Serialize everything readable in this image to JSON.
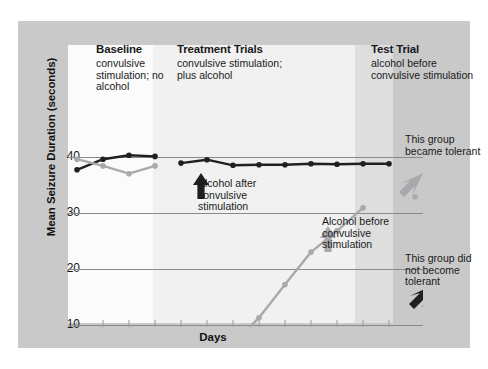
{
  "figure": {
    "y_axis_title": "Mean Seizure Duration (seconds)",
    "x_axis_title": "Days",
    "y_ticks": [
      "40",
      "30",
      "20",
      "10"
    ]
  },
  "sections": [
    {
      "id": "baseline",
      "title": "Baseline",
      "subtitle": "convulsive stimulation; no alcohol"
    },
    {
      "id": "treatment",
      "title": "Treatment Trials",
      "subtitle": "convulsive stimulation; plus alcohol"
    },
    {
      "id": "test",
      "title": "Test Trial",
      "subtitle": "alcohol before convulsive stimulation"
    }
  ],
  "callouts": [
    {
      "id": "alcohol-after",
      "text": "Alcohol after convulsive stimulation",
      "arrow": "up-arrow-black"
    },
    {
      "id": "alcohol-before",
      "text": "Alcohol before convulsive stimulation",
      "arrow": "up-arrow-grey"
    },
    {
      "id": "became-tolerant",
      "text": "This group became tolerant",
      "arrow": "down-left-arrow-grey"
    },
    {
      "id": "not-tolerant",
      "text": "This group did not become tolerant",
      "arrow": "down-left-arrow-black"
    }
  ],
  "colors": {
    "series_dark": "#231f20",
    "series_light": "#a7a9ac",
    "panel": "#c9c9c9",
    "band_baseline": "#fbfbfb",
    "band_treatment": "#f1f1f1",
    "band_test": "#dedede",
    "gridline": "#8a8a8a"
  },
  "chart_data": {
    "type": "line",
    "title": "",
    "xlabel": "Days",
    "ylabel": "Mean Seizure Duration (seconds)",
    "ylim": [
      0,
      45
    ],
    "yticks": [
      10,
      20,
      30,
      40
    ],
    "grid": "horizontal",
    "legend": "none",
    "phases": [
      {
        "name": "Baseline",
        "x_start": 1,
        "x_end": 4
      },
      {
        "name": "Treatment Trials",
        "x_start": 5,
        "x_end": 13
      },
      {
        "name": "Test Trial",
        "x_start": 14,
        "x_end": 14
      }
    ],
    "series": [
      {
        "name": "Alcohol after convulsive stimulation (did not become tolerant)",
        "color": "#231f20",
        "x": [
          1,
          2,
          3,
          4,
          5,
          6,
          7,
          8,
          9,
          10,
          11,
          12,
          13,
          14
        ],
        "values": [
          37.8,
          39.7,
          40.4,
          40.2,
          39.0,
          39.6,
          38.6,
          38.7,
          38.7,
          38.9,
          38.8,
          38.9,
          38.9,
          3.0
        ]
      },
      {
        "name": "Alcohol before convulsive stimulation (became tolerant)",
        "color": "#a7a9ac",
        "x": [
          1,
          2,
          3,
          4,
          5,
          6,
          7,
          8,
          9,
          10,
          11,
          12,
          13,
          14
        ],
        "values": [
          39.7,
          38.5,
          37.1,
          38.5,
          2.6,
          4.3,
          6.7,
          11.4,
          17.3,
          23.1,
          26.9,
          31.0,
          null,
          33.0
        ]
      }
    ],
    "annotations": [
      "Alcohol after convulsive stimulation",
      "Alcohol before convulsive stimulation",
      "This group became tolerant",
      "This group did not become tolerant"
    ]
  }
}
